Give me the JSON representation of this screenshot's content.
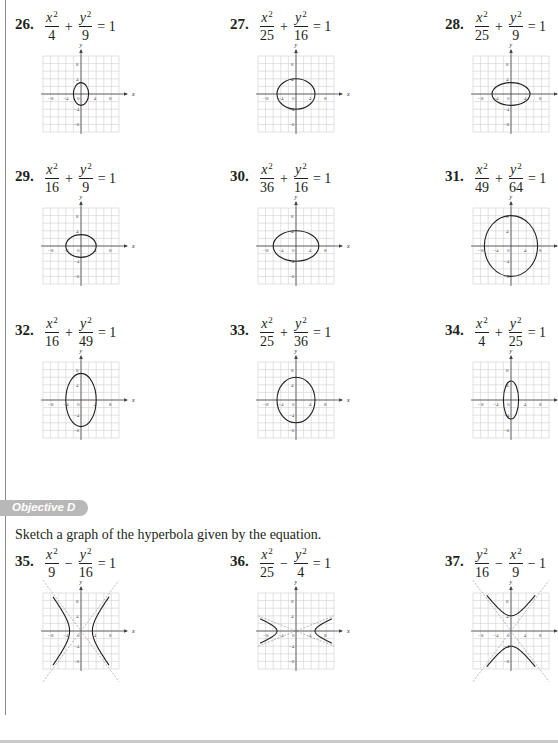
{
  "ellipse_section": {
    "problems": [
      {
        "number": "26.",
        "equation": {
          "t1_num": "x",
          "t1_den": "4",
          "op": "+",
          "t2_num": "y",
          "t2_den": "9",
          "rhs": "= 1"
        },
        "type": "ellipse",
        "a": 2,
        "b": 3
      },
      {
        "number": "27.",
        "equation": {
          "t1_num": "x",
          "t1_den": "25",
          "op": "+",
          "t2_num": "y",
          "t2_den": "16",
          "rhs": "= 1"
        },
        "type": "ellipse",
        "a": 5,
        "b": 4
      },
      {
        "number": "28.",
        "equation": {
          "t1_num": "x",
          "t1_den": "25",
          "op": "+",
          "t2_num": "y",
          "t2_den": "9",
          "rhs": "= 1"
        },
        "type": "ellipse",
        "a": 5,
        "b": 3
      },
      {
        "number": "29.",
        "equation": {
          "t1_num": "x",
          "t1_den": "16",
          "op": "+",
          "t2_num": "y",
          "t2_den": "9",
          "rhs": "= 1"
        },
        "type": "ellipse",
        "a": 4,
        "b": 3
      },
      {
        "number": "30.",
        "equation": {
          "t1_num": "x",
          "t1_den": "36",
          "op": "+",
          "t2_num": "y",
          "t2_den": "16",
          "rhs": "= 1"
        },
        "type": "ellipse",
        "a": 6,
        "b": 4
      },
      {
        "number": "31.",
        "equation": {
          "t1_num": "x",
          "t1_den": "49",
          "op": "+",
          "t2_num": "y",
          "t2_den": "64",
          "rhs": "= 1"
        },
        "type": "ellipse",
        "a": 7,
        "b": 8
      },
      {
        "number": "32.",
        "equation": {
          "t1_num": "x",
          "t1_den": "16",
          "op": "+",
          "t2_num": "y",
          "t2_den": "49",
          "rhs": "= 1"
        },
        "type": "ellipse",
        "a": 4,
        "b": 7
      },
      {
        "number": "33.",
        "equation": {
          "t1_num": "x",
          "t1_den": "25",
          "op": "+",
          "t2_num": "y",
          "t2_den": "36",
          "rhs": "= 1"
        },
        "type": "ellipse",
        "a": 5,
        "b": 6
      },
      {
        "number": "34.",
        "equation": {
          "t1_num": "x",
          "t1_den": "4",
          "op": "+",
          "t2_num": "y",
          "t2_den": "25",
          "rhs": "= 1"
        },
        "type": "ellipse",
        "a": 2,
        "b": 5
      }
    ]
  },
  "objective_d": {
    "badge": "Objective D",
    "instruction": "Sketch a graph of the hyperbola given by the equation.",
    "problems": [
      {
        "number": "35.",
        "equation": {
          "t1_num": "x",
          "t1_den": "9",
          "op": "−",
          "t2_num": "y",
          "t2_den": "16",
          "rhs": "= 1"
        },
        "type": "hyperbola-x",
        "a": 3,
        "b": 4
      },
      {
        "number": "36.",
        "equation": {
          "t1_num": "x",
          "t1_den": "25",
          "op": "−",
          "t2_num": "y",
          "t2_den": "4",
          "rhs": "= 1"
        },
        "type": "hyperbola-x",
        "a": 5,
        "b": 2
      },
      {
        "number": "37.",
        "equation": {
          "t1_num": "y",
          "t1_den": "16",
          "op": "−",
          "t2_num": "x",
          "t2_den": "9",
          "rhs": "− 1"
        },
        "type": "hyperbola-y",
        "a": 4,
        "b": 3
      }
    ]
  },
  "graph_axes": {
    "x_label": "x",
    "y_label": "y",
    "x_ticks": [
      "−8",
      "−4",
      "0",
      "4",
      "8"
    ],
    "y_ticks": [
      "8",
      "4",
      "−4",
      "−8"
    ],
    "range": [
      -10,
      10
    ],
    "grid_step": 2
  },
  "colors": {
    "ink": "#231f20",
    "grid": "#cfcfcf",
    "axis": "#444444",
    "asymptote": "#888888",
    "badge": "#b8b8b8",
    "rule": "#8a8a8a"
  }
}
